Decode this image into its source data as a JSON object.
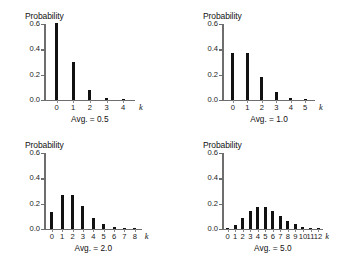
{
  "figure": {
    "panel_count": 4,
    "background_color": "#ffffff",
    "bar_color": "#111111",
    "axis_color": "#6e6e6e"
  },
  "chart_data": [
    {
      "type": "bar",
      "title": "",
      "ylabel": "Probability",
      "xlabel": "k",
      "annotation": "Avg. = 0.5",
      "mean": 0.5,
      "categories": [
        "0",
        "1",
        "2",
        "3",
        "4"
      ],
      "values": [
        0.607,
        0.303,
        0.076,
        0.013,
        0.0016
      ],
      "ylim": [
        0,
        0.6
      ],
      "yticks": [
        0.0,
        0.2,
        0.4,
        0.6
      ],
      "ytick_labels": [
        "0.0",
        "0.2",
        "0.4",
        "0.6"
      ],
      "grid": false,
      "legend": "none"
    },
    {
      "type": "bar",
      "title": "",
      "ylabel": "Probability",
      "xlabel": "k",
      "annotation": "Avg. = 1.0",
      "mean": 1.0,
      "categories": [
        "0",
        "1",
        "2",
        "3",
        "4",
        "5"
      ],
      "values": [
        0.368,
        0.368,
        0.184,
        0.061,
        0.015,
        0.003
      ],
      "ylim": [
        0,
        0.6
      ],
      "yticks": [
        0.0,
        0.2,
        0.4,
        0.6
      ],
      "ytick_labels": [
        "0.0",
        "0.2",
        "0.4",
        "0.6"
      ],
      "grid": false,
      "legend": "none"
    },
    {
      "type": "bar",
      "title": "",
      "ylabel": "Probability",
      "xlabel": "k",
      "annotation": "Avg. = 2.0",
      "mean": 2.0,
      "categories": [
        "0",
        "1",
        "2",
        "3",
        "4",
        "5",
        "6",
        "7",
        "8"
      ],
      "values": [
        0.135,
        0.271,
        0.271,
        0.18,
        0.09,
        0.036,
        0.012,
        0.0034,
        0.0009
      ],
      "ylim": [
        0,
        0.6
      ],
      "yticks": [
        0.0,
        0.2,
        0.4,
        0.6
      ],
      "ytick_labels": [
        "0.0",
        "0.2",
        "0.4",
        "0.6"
      ],
      "grid": false,
      "legend": "none"
    },
    {
      "type": "bar",
      "title": "",
      "ylabel": "Probability",
      "xlabel": "k",
      "annotation": "Avg. = 5.0",
      "mean": 5.0,
      "categories": [
        "0",
        "1",
        "2",
        "3",
        "4",
        "5",
        "6",
        "7",
        "8",
        "9",
        "10",
        "11",
        "12"
      ],
      "values": [
        0.007,
        0.034,
        0.084,
        0.14,
        0.175,
        0.175,
        0.146,
        0.104,
        0.065,
        0.036,
        0.018,
        0.008,
        0.003
      ],
      "ylim": [
        0,
        0.6
      ],
      "yticks": [
        0.0,
        0.2,
        0.4,
        0.6
      ],
      "ytick_labels": [
        "0.0",
        "0.2",
        "0.4",
        "0.6"
      ],
      "grid": false,
      "legend": "none"
    }
  ]
}
